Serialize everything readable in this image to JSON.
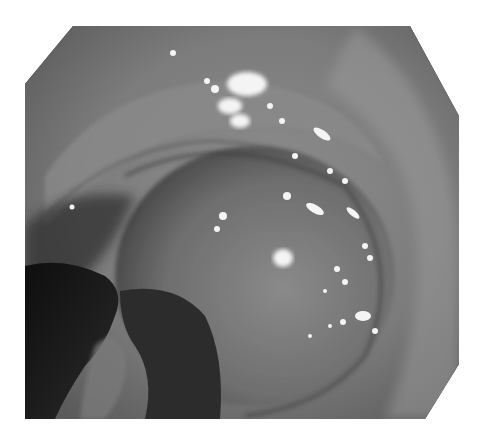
{
  "image": {
    "description": "Grayscale endoscopic photograph of a lumen with a mucosal fold, specular highlights and a dark instrument tip at lower left",
    "colors": {
      "background": "#ffffff",
      "corner_mask": "#111111",
      "mucosa_light": "#9a9a9a",
      "mucosa_mid": "#777777",
      "shadow": "#222222",
      "highlight": "#f4f4f4"
    }
  }
}
